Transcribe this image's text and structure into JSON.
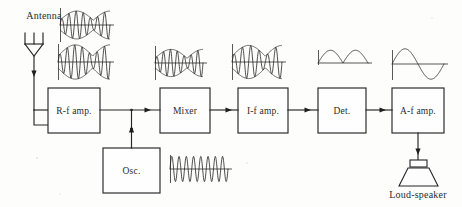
{
  "diagram": {
    "background_color": "#fdfdfc",
    "line_color": "#262626",
    "text_color": "#2b2b2b"
  },
  "labels": {
    "antenna": "Antenna",
    "loudspeaker": "Loud-speaker"
  },
  "blocks": [
    {
      "id": "rf-amp",
      "label": "R-f amp.",
      "x": 48,
      "y": 88,
      "w": 52,
      "h": 45
    },
    {
      "id": "mixer",
      "label": "Mixer",
      "x": 160,
      "y": 88,
      "w": 50,
      "h": 45
    },
    {
      "id": "if-amp",
      "label": "I-f amp.",
      "x": 238,
      "y": 88,
      "w": 50,
      "h": 45
    },
    {
      "id": "det",
      "label": "Det.",
      "x": 318,
      "y": 88,
      "w": 48,
      "h": 45
    },
    {
      "id": "af-amp",
      "label": "A-f amp.",
      "x": 392,
      "y": 88,
      "w": 52,
      "h": 45
    },
    {
      "id": "osc",
      "label": "Osc.",
      "x": 103,
      "y": 148,
      "w": 57,
      "h": 45
    }
  ],
  "waveforms": [
    {
      "id": "antenna-rf-modulated",
      "name": "modulated-rf-signal-small",
      "kind": "am-modulated",
      "x": 60,
      "y": 8,
      "w": 50,
      "h": 34,
      "carrier_cycles": 7,
      "envelope_cycles": 1.5,
      "amplitude": 0.82,
      "axis": true
    },
    {
      "id": "rfamp-out-modulated",
      "name": "amplified-modulated-rf-signal",
      "kind": "am-modulated",
      "x": 58,
      "y": 44,
      "w": 52,
      "h": 36,
      "carrier_cycles": 7,
      "envelope_cycles": 1.5,
      "amplitude": 0.95,
      "axis": true
    },
    {
      "id": "mixer-in-modulated",
      "name": "mixer-input-modulated-signal",
      "kind": "am-modulated",
      "x": 155,
      "y": 46,
      "w": 48,
      "h": 34,
      "carrier_cycles": 7,
      "envelope_cycles": 1.5,
      "amplitude": 0.8,
      "axis": true
    },
    {
      "id": "ifamp-in-modulated",
      "name": "intermediate-frequency-modulated-signal",
      "kind": "am-modulated",
      "x": 232,
      "y": 44,
      "w": 50,
      "h": 36,
      "carrier_cycles": 6,
      "envelope_cycles": 1.5,
      "amplitude": 0.92,
      "axis": true
    },
    {
      "id": "osc-sine",
      "name": "local-oscillator-sine-wave",
      "kind": "plain-sine",
      "x": 170,
      "y": 155,
      "w": 58,
      "h": 28,
      "carrier_cycles": 8,
      "amplitude": 0.9,
      "axis": true
    },
    {
      "id": "det-out-rectified",
      "name": "detected-rectified-audio-signal",
      "kind": "rectified",
      "x": 318,
      "y": 48,
      "w": 50,
      "h": 30,
      "cycles": 2,
      "amplitude": 0.85,
      "axis": true
    },
    {
      "id": "afamp-out-audio",
      "name": "amplified-audio-sine-wave",
      "kind": "audio-sine",
      "x": 392,
      "y": 48,
      "w": 52,
      "h": 32,
      "cycles": 1,
      "amplitude": 0.95,
      "axis": true
    }
  ],
  "connections": [
    {
      "id": "antenna-to-rfamp",
      "name": "antenna-feed-line"
    },
    {
      "id": "rfamp-to-mixer",
      "name": "rf-to-mixer-wire"
    },
    {
      "id": "osc-to-mixer",
      "name": "oscillator-to-mixer-wire"
    },
    {
      "id": "mixer-to-ifamp",
      "name": "mixer-to-if-wire"
    },
    {
      "id": "ifamp-to-det",
      "name": "if-to-detector-wire"
    },
    {
      "id": "det-to-afamp",
      "name": "detector-to-af-wire"
    },
    {
      "id": "afamp-to-speaker",
      "name": "af-to-speaker-wire"
    }
  ]
}
